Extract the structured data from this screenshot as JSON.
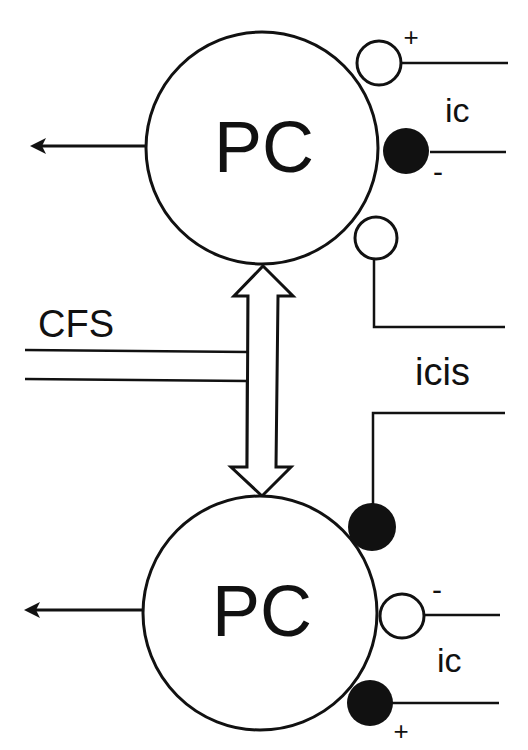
{
  "diagram": {
    "top_cell": {
      "label": "PC"
    },
    "bottom_cell": {
      "label": "PC"
    },
    "top_ic": {
      "label": "ic",
      "plus_sign": "+",
      "minus_sign": "-"
    },
    "bottom_ic": {
      "label": "ic",
      "plus_sign": "+",
      "minus_sign": "-"
    },
    "cfs": {
      "label": "CFS"
    },
    "icis": {
      "label": "icis"
    },
    "colors": {
      "stroke": "#111111",
      "fill_filled": "#111111",
      "background": "#ffffff"
    }
  }
}
